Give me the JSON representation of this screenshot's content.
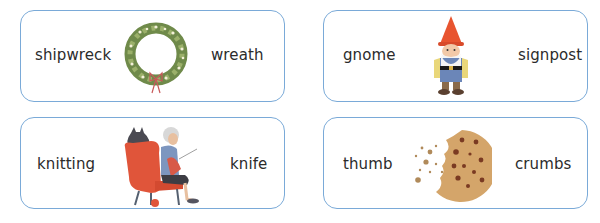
{
  "cards": [
    {
      "left_word": "shipwreck",
      "right_word": "wreath",
      "picture": "wreath-picture"
    },
    {
      "left_word": "gnome",
      "right_word": "signpost",
      "picture": "gnome-picture"
    },
    {
      "left_word": "knitting",
      "right_word": "knife",
      "picture": "grandma-knitting-picture"
    },
    {
      "left_word": "thumb",
      "right_word": "crumbs",
      "picture": "cookie-crumbs-picture"
    }
  ],
  "colors": {
    "card_border": "#7aaad8",
    "text": "#2b2b2b"
  }
}
